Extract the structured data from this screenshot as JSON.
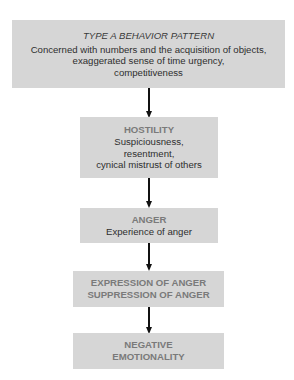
{
  "diagram": {
    "boxes": [
      {
        "title": "TYPE A BEHAVIOR PATTERN",
        "lines": [
          "Concerned with numbers and the acquisition of objects,",
          "exaggerated sense of time urgency,",
          "competitiveness"
        ]
      },
      {
        "title": "HOSTILITY",
        "lines": [
          "Suspiciousness,",
          "resentment,",
          "cynical mistrust of others"
        ]
      },
      {
        "title": "ANGER",
        "lines": [
          "Experience of anger"
        ]
      },
      {
        "title_lines": [
          "EXPRESSION OF ANGER",
          "SUPPRESSION OF ANGER"
        ]
      },
      {
        "title_lines": [
          "NEGATIVE",
          "EMOTIONALITY"
        ]
      }
    ],
    "colors": {
      "box_fill": "#d6d6d6",
      "heading_gray": "#7a7a7a",
      "text": "#2e2e2e",
      "arrow": "#111111"
    }
  }
}
